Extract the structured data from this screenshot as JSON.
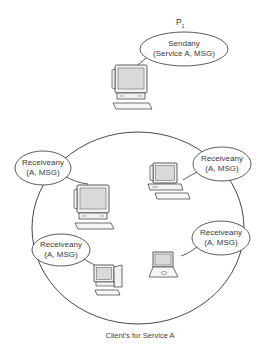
{
  "diagram": {
    "sender": {
      "node_label": "P",
      "node_subscript": "1",
      "line1": "Sendany",
      "line2": "(Service A, MSG)",
      "device": "desktop-computer"
    },
    "receivers": [
      {
        "id": "left",
        "line1": "Receiveany",
        "line2": "(A, MSG)",
        "device": "desktop-computer"
      },
      {
        "id": "right",
        "line1": "Receiveany",
        "line2": "(A, MSG)",
        "device": "desktop-computer"
      },
      {
        "id": "bottom-left",
        "line1": "Receiveany",
        "line2": "(A, MSG)",
        "device": "tower-computer"
      },
      {
        "id": "bottom-right",
        "line1": "Receiveany",
        "line2": "(A, MSG)",
        "device": "laptop-computer"
      }
    ],
    "group_caption": "Client's for Service A"
  },
  "colors": {
    "stroke": "#333333",
    "screen_fill": "#d9d9d9",
    "text": "#3a3a3a"
  }
}
